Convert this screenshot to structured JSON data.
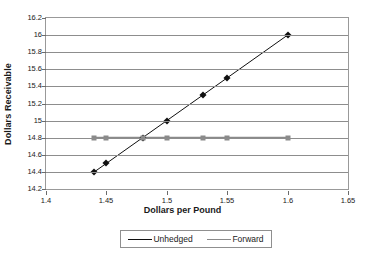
{
  "chart_data": {
    "type": "line",
    "title": "",
    "xlabel": "Dollars per Pound",
    "ylabel": "Dollars Receivable",
    "xlim": [
      1.4,
      1.65
    ],
    "ylim": [
      14.2,
      16.2
    ],
    "xticks": [
      "1.4",
      "1.45",
      "1.5",
      "1.55",
      "1.6",
      "1.65"
    ],
    "xtick_values": [
      1.4,
      1.45,
      1.5,
      1.55,
      1.6,
      1.65
    ],
    "yticks": [
      "14.2",
      "14.4",
      "14.6",
      "14.8",
      "15",
      "15.2",
      "15.4",
      "15.6",
      "15.8",
      "16",
      "16.2"
    ],
    "ytick_values": [
      14.2,
      14.4,
      14.6,
      14.8,
      15.0,
      15.2,
      15.4,
      15.6,
      15.8,
      16.0,
      16.2
    ],
    "grid": "horizontal",
    "legend_position": "bottom",
    "x": [
      1.44,
      1.45,
      1.48,
      1.5,
      1.53,
      1.55,
      1.6
    ],
    "series": [
      {
        "name": "Unhedged",
        "color": "#101010",
        "marker": "diamond",
        "values": [
          14.4,
          14.5,
          14.8,
          15.0,
          15.3,
          15.5,
          16.0
        ]
      },
      {
        "name": "Forward",
        "color": "#8a8a8a",
        "marker": "square",
        "values": [
          14.8,
          14.8,
          14.8,
          14.8,
          14.8,
          14.8,
          14.8
        ]
      }
    ]
  },
  "legend": {
    "entries": [
      {
        "label": "Unhedged"
      },
      {
        "label": "Forward"
      }
    ]
  },
  "colors": {
    "unhedged": "#101010",
    "forward": "#8a8a8a",
    "gridline": "#8d8d8d",
    "axis": "#999999",
    "text": "#1a1a1a"
  }
}
